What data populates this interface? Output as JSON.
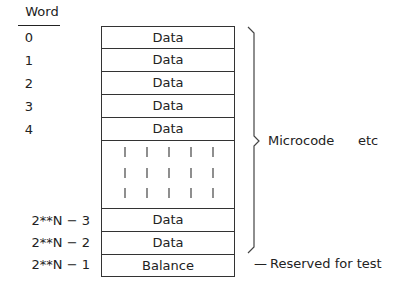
{
  "header": {
    "title": "Word"
  },
  "rows": [
    {
      "index": "0",
      "label": "Data"
    },
    {
      "index": "1",
      "label": "Data"
    },
    {
      "index": "2",
      "label": "Data"
    },
    {
      "index": "3",
      "label": "Data"
    },
    {
      "index": "4",
      "label": "Data"
    },
    {
      "index": "",
      "label": ""
    },
    {
      "index": "2**N − 3",
      "label": "Data"
    },
    {
      "index": "2**N − 2",
      "label": "Data"
    },
    {
      "index": "2**N − 1",
      "label": "Balance"
    }
  ],
  "annotations": {
    "brace_label_1": "Microcode",
    "brace_label_2": "etc",
    "reserved_dash": "—",
    "reserved_label": "Reserved for test"
  }
}
